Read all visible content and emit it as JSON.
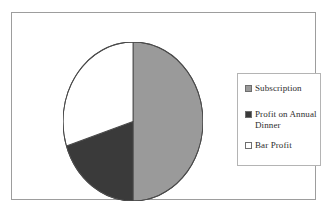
{
  "figure": {
    "name": "pie-chart-figure",
    "frame_border_color": "#9d9d9d",
    "background": "#ffffff"
  },
  "legend": {
    "position": "right",
    "border_color": "#b4b4b4",
    "items": [
      {
        "label": "Subscription",
        "color": "#9a9a9a"
      },
      {
        "label": "Profit on Annual Dinner",
        "color": "#3a3a3a"
      },
      {
        "label": "Bar Profit",
        "color": "#ffffff"
      }
    ]
  },
  "chart_data": {
    "type": "pie",
    "title": "",
    "subtitle": "",
    "xlabel": "",
    "ylabel": "",
    "grid": false,
    "legend_position": "right",
    "labels": [
      "Subscription",
      "Profit on Annual Dinner",
      "Bar Profit"
    ],
    "values": [
      50,
      20,
      30
    ],
    "unit": "percent",
    "colors": [
      "#9a9a9a",
      "#3a3a3a",
      "#ffffff"
    ],
    "edge_color": "#4a4a4a",
    "start_angle_deg": 90,
    "direction": "clockwise",
    "slices": [
      {
        "label": "Subscription",
        "value": 50,
        "color": "#9a9a9a",
        "start_deg": 0,
        "end_deg": 180
      },
      {
        "label": "Profit on Annual Dinner",
        "value": 20,
        "color": "#3a3a3a",
        "start_deg": 180,
        "end_deg": 252
      },
      {
        "label": "Bar Profit",
        "value": 30,
        "color": "#ffffff",
        "start_deg": 252,
        "end_deg": 360
      }
    ]
  }
}
